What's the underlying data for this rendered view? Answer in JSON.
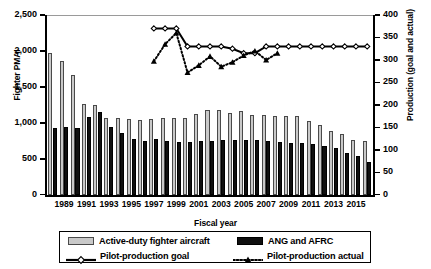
{
  "chart_data": {
    "type": "bar",
    "title": "",
    "xlabel": "Fiscal year",
    "ylabel": "Fighter PMAI",
    "ylabel_right": "Production (goal and actual)",
    "grid": false,
    "legend_position": "bottom",
    "ylim": [
      0,
      2500
    ],
    "ylim_right": [
      0,
      400
    ],
    "yticks": [
      "0",
      "500",
      "1,000",
      "1,500",
      "2,000",
      "2,500"
    ],
    "ytick_values": [
      0,
      500,
      1000,
      1500,
      2000,
      2500
    ],
    "yticks_right": [
      "0",
      "50",
      "100",
      "150",
      "200",
      "250",
      "300",
      "350",
      "400"
    ],
    "ytick_values_right": [
      0,
      50,
      100,
      150,
      200,
      250,
      300,
      350,
      400
    ],
    "categories": [
      "1988",
      "1989",
      "1990",
      "1991",
      "1992",
      "1993",
      "1994",
      "1995",
      "1996",
      "1997",
      "1998",
      "1999",
      "2000",
      "2001",
      "2002",
      "2003",
      "2004",
      "2005",
      "2006",
      "2007",
      "2008",
      "2009",
      "2010",
      "2011",
      "2012",
      "2013",
      "2014",
      "2015",
      "2016"
    ],
    "xtick_labels": [
      "1989",
      "1991",
      "1993",
      "1995",
      "1997",
      "1999",
      "2001",
      "2003",
      "2005",
      "2007",
      "2009",
      "2011",
      "2013",
      "2015"
    ],
    "xtick_categories": [
      "1989",
      "1991",
      "1993",
      "1995",
      "1997",
      "1999",
      "2001",
      "2003",
      "2005",
      "2007",
      "2009",
      "2011",
      "2013",
      "2015"
    ],
    "series": [
      {
        "name": "Active-duty fighter aircraft",
        "axis": "left",
        "kind": "bar",
        "color": "#c9c9c9",
        "values": [
          1975,
          1855,
          1660,
          1265,
          1250,
          1070,
          1065,
          1060,
          1035,
          1055,
          1075,
          1065,
          1065,
          1125,
          1180,
          1185,
          1135,
          1170,
          1105,
          1105,
          1100,
          1090,
          1090,
          1025,
          975,
          890,
          840,
          760,
          755
        ]
      },
      {
        "name": "ANG and AFRC",
        "axis": "left",
        "kind": "bar",
        "color": "#101010",
        "values": [
          930,
          940,
          930,
          1080,
          1150,
          940,
          855,
          780,
          745,
          770,
          750,
          740,
          740,
          755,
          755,
          760,
          760,
          760,
          760,
          755,
          740,
          720,
          715,
          700,
          680,
          650,
          585,
          540,
          455
        ]
      },
      {
        "name": "Pilot-production goal",
        "axis": "right",
        "kind": "line",
        "marker": "open-diamond",
        "linestyle": "solid",
        "values": [
          null,
          null,
          null,
          null,
          null,
          null,
          null,
          null,
          null,
          370,
          370,
          370,
          330,
          330,
          330,
          330,
          325,
          315,
          315,
          330,
          330,
          330,
          330,
          330,
          330,
          330,
          330,
          330,
          330
        ]
      },
      {
        "name": "Pilot-production actual",
        "axis": "right",
        "kind": "line",
        "marker": "filled-triangle",
        "linestyle": "dotted",
        "values": [
          null,
          null,
          null,
          null,
          null,
          null,
          null,
          null,
          null,
          297,
          335,
          360,
          272,
          288,
          308,
          285,
          295,
          310,
          320,
          300,
          315,
          null,
          null,
          null,
          null,
          null,
          null,
          null,
          null
        ]
      }
    ]
  },
  "legend": {
    "entries": [
      {
        "label": "Active-duty fighter aircraft",
        "type": "box",
        "color": "#c9c9c9"
      },
      {
        "label": "ANG and AFRC",
        "type": "box",
        "color": "#101010"
      },
      {
        "label": "Pilot-production goal",
        "type": "line-solid-diamond",
        "color": "#000000"
      },
      {
        "label": "Pilot-production actual",
        "type": "line-dotted-triangle",
        "color": "#000000"
      }
    ]
  }
}
